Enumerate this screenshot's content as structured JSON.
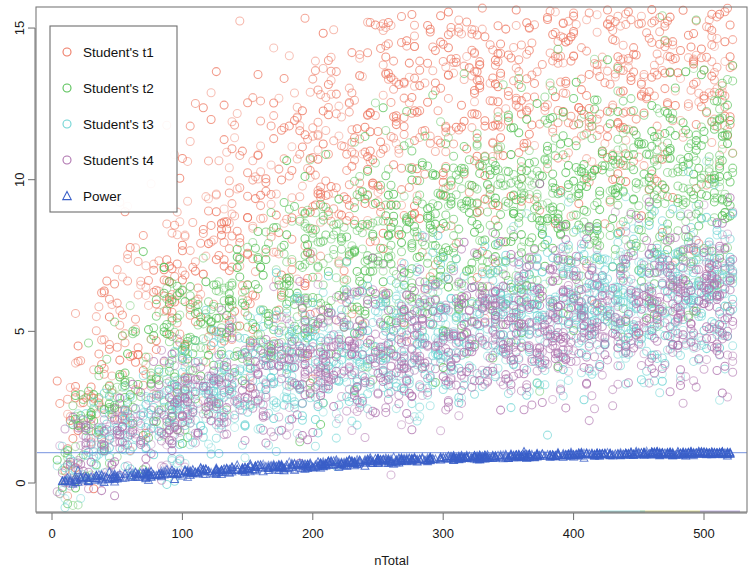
{
  "chart_data": {
    "type": "scatter",
    "title": "",
    "subtitle": "",
    "xlabel": "nTotal",
    "ylabel": "",
    "xlim": [
      -12,
      530
    ],
    "ylim": [
      -1.1,
      15.6
    ],
    "xticks": [
      0,
      100,
      200,
      300,
      400,
      500
    ],
    "xtick_labels": [
      "0",
      "100",
      "200",
      "300",
      "400",
      "500"
    ],
    "yticks": [
      0,
      5,
      10,
      15
    ],
    "ytick_labels": [
      "0",
      "5",
      "10",
      "15"
    ],
    "grid": false,
    "legend_position": "top-left",
    "reference_line": {
      "orientation": "horizontal",
      "y": 1.0,
      "color": "#4A6FD4"
    },
    "marker_styles": {
      "circle": "open-circle",
      "triangle": "open-triangle-up"
    },
    "series": [
      {
        "name": "Student's t1",
        "color": "#EE7A64",
        "marker": "circle",
        "trend": "increasing-sqrt",
        "y_at_x": {
          "10": 1.6,
          "25": 3.2,
          "50": 4.8,
          "100": 7.0,
          "150": 8.6,
          "200": 10.2,
          "250": 11.6,
          "300": 12.6,
          "350": 13.4,
          "400": 14.0,
          "450": 14.4,
          "500": 14.8
        },
        "spread": 2.6,
        "n_points": 1400
      },
      {
        "name": "Student's t2",
        "color": "#57C157",
        "marker": "circle",
        "trend": "increasing-sqrt",
        "y_at_x": {
          "10": 0.9,
          "25": 1.9,
          "50": 3.0,
          "100": 4.5,
          "150": 5.6,
          "200": 6.6,
          "250": 7.5,
          "300": 8.2,
          "350": 8.8,
          "400": 9.3,
          "450": 9.7,
          "500": 10.1
        },
        "spread": 1.8,
        "n_points": 1400
      },
      {
        "name": "Student's t3",
        "color": "#6FD4D4",
        "marker": "circle",
        "trend": "increasing-sqrt",
        "y_at_x": {
          "10": 0.5,
          "25": 1.1,
          "50": 1.8,
          "100": 2.7,
          "150": 3.4,
          "200": 4.0,
          "250": 4.5,
          "300": 5.0,
          "350": 5.4,
          "400": 5.7,
          "450": 6.0,
          "500": 6.2
        },
        "spread": 1.25,
        "n_points": 1400
      },
      {
        "name": "Student's t4",
        "color": "#AE73AE",
        "marker": "circle",
        "trend": "increasing-sqrt",
        "y_at_x": {
          "10": 0.45,
          "25": 1.0,
          "50": 1.7,
          "100": 2.6,
          "150": 3.2,
          "200": 3.8,
          "250": 4.3,
          "300": 4.7,
          "350": 5.1,
          "400": 5.4,
          "450": 5.6,
          "500": 5.9
        },
        "spread": 1.2,
        "n_points": 1400
      },
      {
        "name": "Power",
        "color": "#3A5FC8",
        "marker": "triangle",
        "trend": "asymptote-to-1",
        "y_at_x": {
          "10": 0.06,
          "25": 0.12,
          "50": 0.2,
          "100": 0.33,
          "150": 0.47,
          "200": 0.6,
          "250": 0.72,
          "300": 0.81,
          "350": 0.88,
          "400": 0.93,
          "450": 0.96,
          "500": 0.98
        },
        "spread": 0.07,
        "n_points": 900
      }
    ]
  },
  "legend": {
    "items": [
      {
        "label": "Student's t1",
        "color": "#EE7A64",
        "marker": "circle"
      },
      {
        "label": "Student's t2",
        "color": "#57C157",
        "marker": "circle"
      },
      {
        "label": "Student's t3",
        "color": "#6FD4D4",
        "marker": "circle"
      },
      {
        "label": "Student's t4",
        "color": "#AE73AE",
        "marker": "circle"
      },
      {
        "label": "Power",
        "color": "#3A5FC8",
        "marker": "triangle"
      }
    ]
  },
  "axes": {
    "x_title": "nTotal",
    "y_title": ""
  }
}
